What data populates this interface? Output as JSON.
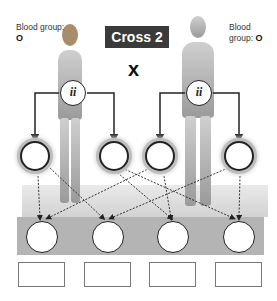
{
  "title": "Cross 2",
  "cross_symbol": "x",
  "female": {
    "blood_group_label": "Blood group:",
    "blood_group_value": "O",
    "genotype": "ii",
    "gametes": [
      "",
      ""
    ]
  },
  "male": {
    "blood_group_label": "Blood group:",
    "blood_group_value": "O",
    "genotype": "ii",
    "gametes": [
      "",
      ""
    ]
  },
  "offspring": {
    "genotypes": [
      "",
      "",
      "",
      ""
    ],
    "phenotype_labels": [
      "",
      "",
      "",
      ""
    ]
  },
  "colors": {
    "title_bg": "#3a3a3a",
    "platform_top": "#dcdcdc",
    "platform_front": "#b4b4b4"
  }
}
